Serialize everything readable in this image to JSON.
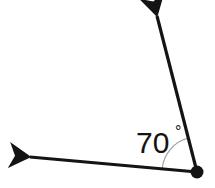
{
  "figure": {
    "type": "angle-diagram",
    "background_color": "#ffffff",
    "width": 215,
    "height": 188
  },
  "geometry": {
    "vertex": {
      "x": 197,
      "y": 172,
      "dot_radius": 6.5,
      "color": "#141414"
    },
    "rays": [
      {
        "name": "upper-ray",
        "from_x": 197,
        "from_y": 172,
        "to_x": 157,
        "to_y": 16,
        "tip_x": 156,
        "tip_y": 9,
        "stroke_width": 3.2,
        "color": "#141414",
        "direction_degrees": 104
      },
      {
        "name": "left-ray",
        "from_x": 197,
        "from_y": 172,
        "to_x": 30,
        "to_y": 157,
        "tip_x": 13,
        "tip_y": 156,
        "stroke_width": 3.2,
        "color": "#141414",
        "direction_degrees": 175
      }
    ],
    "arc": {
      "name": "angle-arc",
      "radius": 35,
      "stroke_width": 1.1,
      "color": "#9a9a9a",
      "start_degrees": 175,
      "end_degrees": 104
    }
  },
  "labels": {
    "angle_value": "70",
    "degree_symbol": "°",
    "angle_full": "70°",
    "text_color": "#141414",
    "text_x": 136,
    "text_y": 153,
    "degree_x": 175,
    "degree_y": 137
  }
}
